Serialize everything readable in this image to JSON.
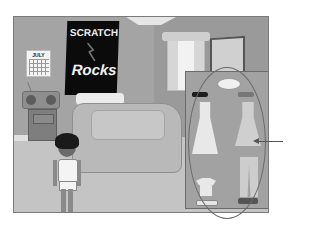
{
  "scene": {
    "type": "Scratch dress-up game stage",
    "poster": {
      "line1": "SCRATCH",
      "line2": "Rocks"
    },
    "calendar": {
      "month": "JULY"
    }
  },
  "wardrobe": {
    "items": [
      {
        "name": "sun hat"
      },
      {
        "name": "sunglasses dark"
      },
      {
        "name": "sunglasses light"
      },
      {
        "name": "white dress"
      },
      {
        "name": "light dress"
      },
      {
        "name": "t-shirt"
      },
      {
        "name": "pants"
      },
      {
        "name": "white shoes"
      },
      {
        "name": "dark sandals"
      }
    ]
  },
  "colors": {
    "stage_bg": "#a9a9a9",
    "poster_bg": "#0b0b0b",
    "annotation": "#555555"
  }
}
